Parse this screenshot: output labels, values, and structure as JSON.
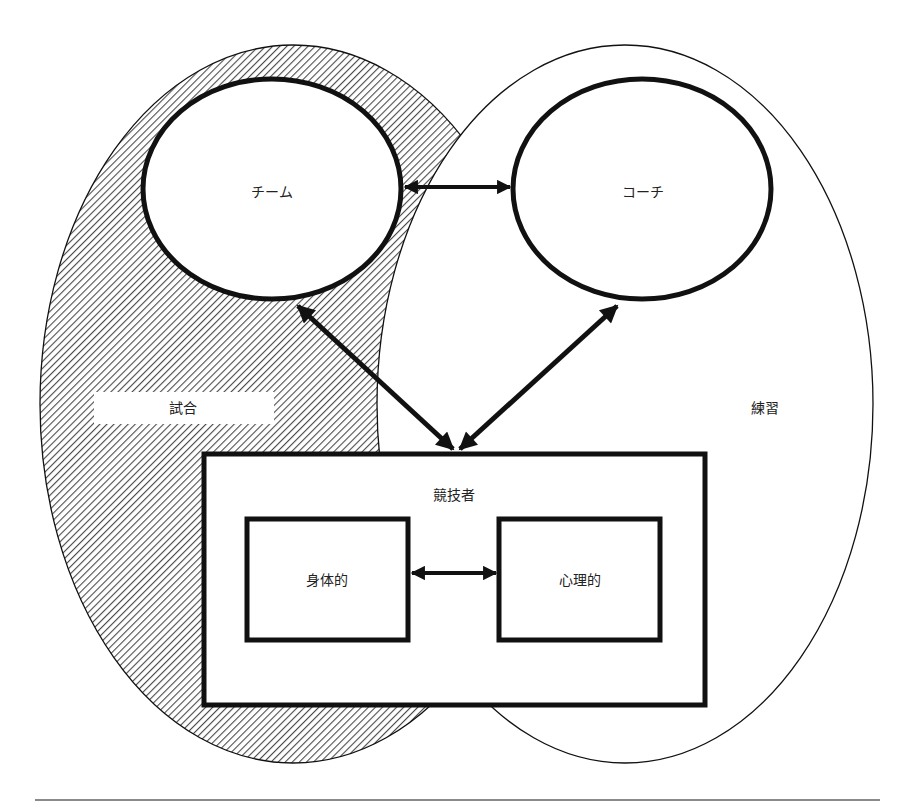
{
  "diagram": {
    "regions": {
      "match": {
        "label": "試合",
        "fill": "hatched"
      },
      "practice": {
        "label": "練習",
        "fill": "white"
      }
    },
    "nodes": {
      "team": {
        "label": "チーム",
        "shape": "ellipse"
      },
      "coach": {
        "label": "コーチ",
        "shape": "ellipse"
      },
      "athlete": {
        "label": "競技者",
        "shape": "rectangle"
      },
      "physical": {
        "label": "身体的",
        "shape": "rectangle"
      },
      "psychological": {
        "label": "心理的",
        "shape": "rectangle"
      }
    },
    "edges": [
      {
        "from": "チーム",
        "to": "コーチ",
        "type": "bidirectional"
      },
      {
        "from": "チーム",
        "to": "競技者",
        "type": "bidirectional"
      },
      {
        "from": "コーチ",
        "to": "競技者",
        "type": "bidirectional"
      },
      {
        "from": "身体的",
        "to": "心理的",
        "type": "bidirectional"
      }
    ],
    "colors": {
      "stroke": "#111111",
      "hatch": "#4a4a4a",
      "background": "#ffffff",
      "rule": "#8a8a8a"
    }
  }
}
